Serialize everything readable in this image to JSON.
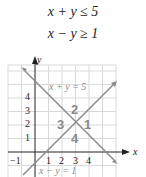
{
  "system": {
    "inequality_1": "x + y ≤ 5",
    "inequality_2": "x − y ≥ 1"
  },
  "graph": {
    "axis_x_label": "x",
    "axis_y_label": "y",
    "x_ticks": [
      "−1",
      "1",
      "2",
      "3",
      "4"
    ],
    "y_ticks": [
      "1",
      "2",
      "3",
      "4"
    ],
    "line_1_label": "x + y = 5",
    "line_2_label": "x − y = 1",
    "regions": [
      "1",
      "2",
      "3",
      "4"
    ],
    "colors": {
      "grid": "#d9d9d9",
      "axis": "#222222",
      "line": "#8a8a8a",
      "region_label": "#8a8a8a"
    }
  }
}
